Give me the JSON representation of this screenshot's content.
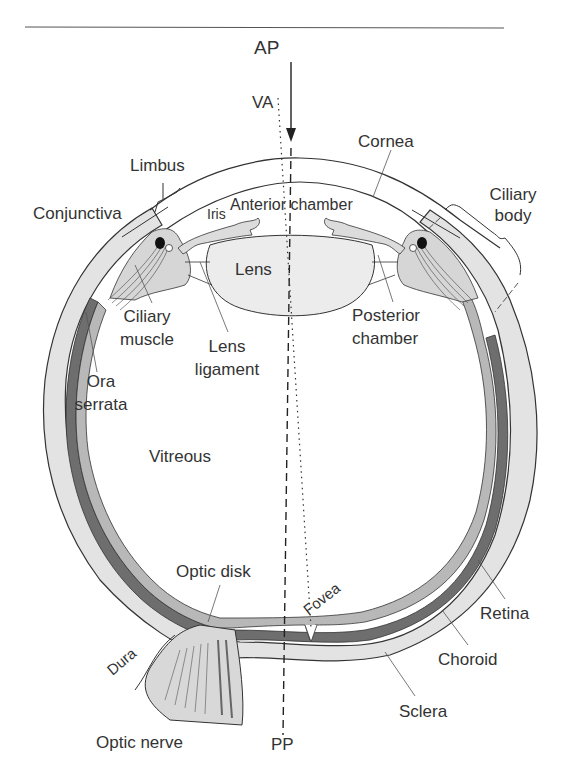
{
  "figure": {
    "colors": {
      "outline": "#333333",
      "sclera_fill": "#e3e3e3",
      "choroid_fill": "#6e6e6e",
      "retina_fill": "#b8b8b8",
      "lens_fill": "#ececec",
      "background": "#ffffff"
    }
  },
  "axes": {
    "ap": "AP",
    "va": "VA",
    "pp": "PP"
  },
  "labels": {
    "limbus": "Limbus",
    "cornea": "Cornea",
    "conjunctiva": "Conjunctiva",
    "iris": "Iris",
    "anterior_chamber": "Anterior chamber",
    "ciliary_body_1": "Ciliary",
    "ciliary_body_2": "body",
    "lens": "Lens",
    "ciliary_muscle_1": "Ciliary",
    "ciliary_muscle_2": "muscle",
    "lens_ligament_1": "Lens",
    "lens_ligament_2": "ligament",
    "posterior_chamber_1": "Posterior",
    "posterior_chamber_2": "chamber",
    "ora_serrata_1": "Ora",
    "ora_serrata_2": "serrata",
    "vitreous": "Vitreous",
    "optic_disk": "Optic disk",
    "fovea": "Fovea",
    "retina": "Retina",
    "dura": "Dura",
    "choroid": "Choroid",
    "optic_nerve": "Optic nerve",
    "sclera": "Sclera"
  }
}
